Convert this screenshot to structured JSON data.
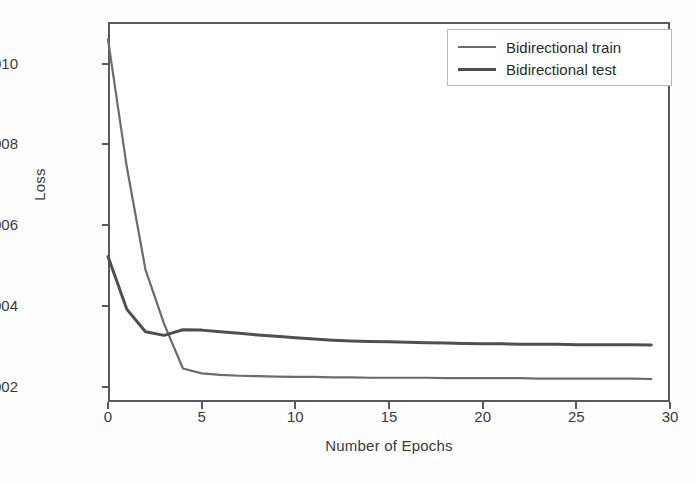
{
  "figure": {
    "title": "",
    "background": "#ffffff",
    "frame_color": "#5a5a5a"
  },
  "axes": {
    "ylabel": "Loss",
    "xlabel": "Number of Epochs",
    "yticks": [
      "0.002",
      "0.004",
      "0.006",
      "0.008",
      "0.010"
    ],
    "xticks": [
      "0",
      "5",
      "10",
      "15",
      "20",
      "25",
      "30"
    ]
  },
  "legend": {
    "position": "upper right",
    "entries": [
      {
        "label": "Bidirectional train",
        "color": "#6b6b6b",
        "width": 2.2
      },
      {
        "label": "Bidirectional test",
        "color": "#4f4f4f",
        "width": 3.0
      }
    ]
  },
  "chart_data": {
    "type": "line",
    "title": "",
    "xlabel": "Number of Epochs",
    "ylabel": "Loss",
    "xlim": [
      0,
      30
    ],
    "ylim": [
      0.00162,
      0.01103
    ],
    "xticks": [
      0,
      5,
      10,
      15,
      20,
      25,
      30
    ],
    "yticks": [
      0.002,
      0.004,
      0.006,
      0.008,
      0.01
    ],
    "grid": false,
    "legend_position": "upper right",
    "x": [
      0,
      1,
      2,
      3,
      4,
      5,
      6,
      7,
      8,
      9,
      10,
      11,
      12,
      13,
      14,
      15,
      16,
      17,
      18,
      19,
      20,
      21,
      22,
      23,
      24,
      25,
      26,
      27,
      28,
      29
    ],
    "series": [
      {
        "name": "Bidirectional train",
        "color": "#6b6b6b",
        "values": [
          0.0106,
          0.00745,
          0.0049,
          0.00355,
          0.00245,
          0.00233,
          0.00229,
          0.00227,
          0.00226,
          0.00225,
          0.00224,
          0.00224,
          0.00223,
          0.00223,
          0.00222,
          0.00222,
          0.00222,
          0.00222,
          0.00221,
          0.00221,
          0.00221,
          0.00221,
          0.00221,
          0.0022,
          0.0022,
          0.0022,
          0.0022,
          0.0022,
          0.0022,
          0.00219
        ]
      },
      {
        "name": "Bidirectional test",
        "color": "#4f4f4f",
        "values": [
          0.00522,
          0.00392,
          0.00336,
          0.00327,
          0.00341,
          0.0034,
          0.00336,
          0.00332,
          0.00328,
          0.00325,
          0.00321,
          0.00318,
          0.00315,
          0.00313,
          0.00312,
          0.00311,
          0.0031,
          0.00309,
          0.00308,
          0.00307,
          0.00306,
          0.00306,
          0.00305,
          0.00305,
          0.00305,
          0.00304,
          0.00304,
          0.00304,
          0.00304,
          0.00303
        ]
      }
    ]
  }
}
